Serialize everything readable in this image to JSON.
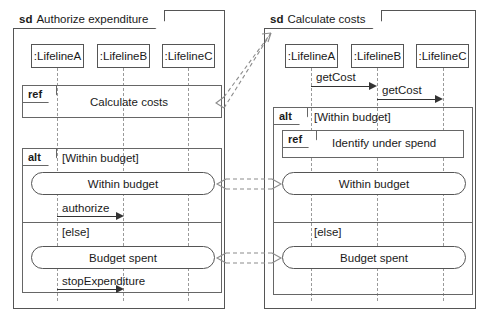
{
  "diagram": {
    "type": "uml-sequence-diagram",
    "colors": {
      "frame_border": "#555555",
      "fragment_border": "#666666",
      "lifeline_dash": "#9a9a9a",
      "message_line": "#333333",
      "connector_dash": "#8c8c8c",
      "background": "#ffffff"
    }
  },
  "left_panel": {
    "keyword": "sd",
    "title": "Authorize expenditure",
    "lifelines": [
      {
        "label": ":LifelineA"
      },
      {
        "label": ":LifelineB"
      },
      {
        "label": ":LifelineC"
      }
    ],
    "ref_fragment": {
      "tag": "ref",
      "label": "Calculate costs"
    },
    "alt_fragment": {
      "tag": "alt",
      "operands": [
        {
          "guard": "[Within budget]",
          "state": "Within budget",
          "message": "authorize"
        },
        {
          "guard": "[else]",
          "state": "Budget spent",
          "message": "stopExpenditure"
        }
      ]
    }
  },
  "right_panel": {
    "keyword": "sd",
    "title": "Calculate costs",
    "lifelines": [
      {
        "label": ":LifelineA"
      },
      {
        "label": ":LifelineB"
      },
      {
        "label": ":LifelineC"
      }
    ],
    "messages": [
      {
        "label": "getCost",
        "from": ":LifelineA",
        "to": ":LifelineB"
      },
      {
        "label": "getCost",
        "from": ":LifelineB",
        "to": ":LifelineC"
      }
    ],
    "alt_fragment": {
      "tag": "alt",
      "operands": [
        {
          "guard": "[Within budget]",
          "ref": {
            "tag": "ref",
            "label": "Identify under spend"
          },
          "state": "Within budget"
        },
        {
          "guard": "[else]",
          "state": "Budget spent"
        }
      ]
    }
  },
  "connectors": [
    {
      "name": "ref-to-frame",
      "style": "dashed-open-arrow",
      "direction": "right-up"
    },
    {
      "name": "within-budget-link",
      "style": "dashed-open-arrow",
      "direction": "bidirectional"
    },
    {
      "name": "budget-spent-link",
      "style": "dashed-open-arrow",
      "direction": "bidirectional"
    }
  ]
}
